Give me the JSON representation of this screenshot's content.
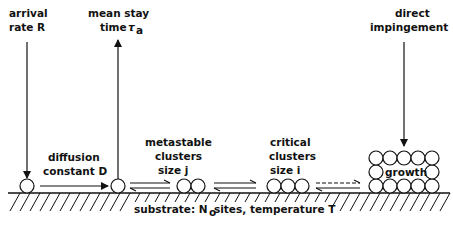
{
  "labels": {
    "arrival_1": "arrival",
    "arrival_2": "rate  R",
    "stay_1": "mean  stay",
    "stay_2": "time",
    "stay_symbol": "τ",
    "stay_sub": "a",
    "diffusion_1": "diffusion",
    "diffusion_2": "constant  D",
    "metastable_1": "metastable",
    "metastable_2": "clusters",
    "metastable_3": "size  j",
    "critical_1": "critical",
    "critical_2": "clusters",
    "critical_3": "size  i",
    "impingement_1": "direct",
    "impingement_2": "impingement",
    "growth": "growth",
    "substrate_a": "substrate:  N",
    "substrate_sub": "o",
    "substrate_b": " sites,  temperature  T"
  },
  "colors": {
    "ink": "#111111",
    "background": "#ffffff"
  }
}
